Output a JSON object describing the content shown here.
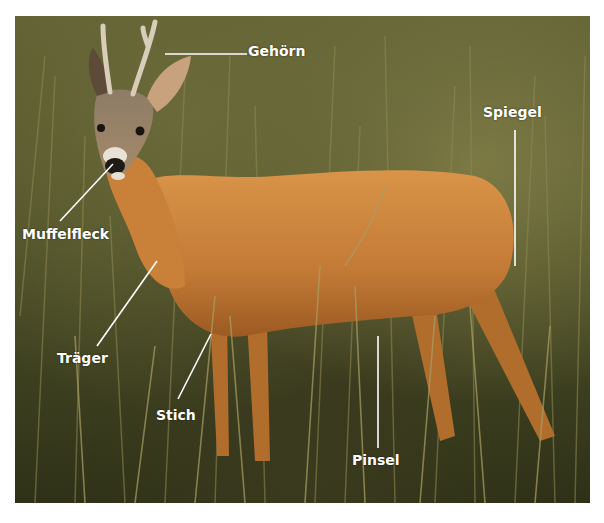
{
  "image": {
    "subject": "roe deer buck standing in tall grass",
    "border_color": "#ffffff",
    "colors": {
      "grass_dark": "#3c3f1f",
      "grass_light": "#8a8650",
      "fur": "#c8833c",
      "label_text": "#ffffff"
    }
  },
  "labels": [
    {
      "id": "gehoern",
      "text": "Gehörn"
    },
    {
      "id": "spiegel",
      "text": "Spiegel"
    },
    {
      "id": "muffelfleck",
      "text": "Muffelfleck"
    },
    {
      "id": "traeger",
      "text": "Träger"
    },
    {
      "id": "stich",
      "text": "Stich"
    },
    {
      "id": "pinsel",
      "text": "Pinsel"
    }
  ]
}
